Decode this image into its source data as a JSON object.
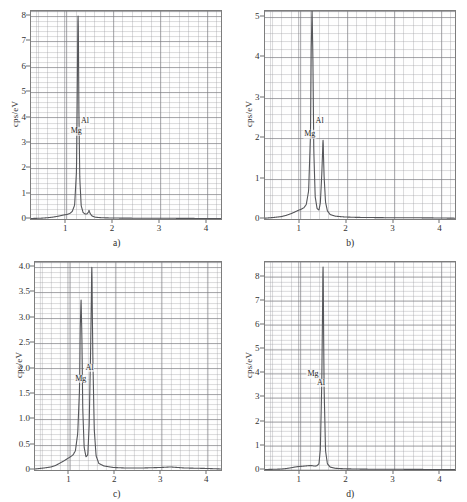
{
  "figure": {
    "panel_count": 4,
    "axis_label": "cps/eV",
    "background": "#ffffff",
    "trace_color": "#55565a",
    "grid_color": "#9a9a9f",
    "frame_color": "#7d7d7d"
  },
  "chart_data": [
    {
      "type": "line",
      "panel": "a",
      "caption": "a)",
      "title": "",
      "xlabel": "",
      "ylabel": "cps/eV",
      "xlim": [
        0.25,
        4.3
      ],
      "ylim": [
        0,
        8.2
      ],
      "xticks": [
        1,
        2,
        3,
        4
      ],
      "xticklabels": [
        "1",
        "2",
        "3",
        "4"
      ],
      "yticks": [
        0,
        1,
        2,
        3,
        4,
        5,
        6,
        7,
        8
      ],
      "yticklabels": [
        "0",
        "1",
        "2",
        "3",
        "4",
        "5",
        "6",
        "7",
        "8"
      ],
      "grid": true,
      "minor_grid": true,
      "annotations": [
        {
          "text": "Mg",
          "x": 1.215,
          "y": 3.45
        },
        {
          "text": "Al",
          "x": 1.4,
          "y": 3.85
        }
      ],
      "peaks": [
        {
          "element": "Mg",
          "x": 1.253,
          "height": 8.0,
          "width": 0.035
        },
        {
          "element": "Al",
          "x": 1.487,
          "height": 0.34,
          "width": 0.03
        }
      ],
      "baseline_noise_level": 0.06,
      "x": [
        0.25,
        0.45,
        0.6,
        0.7,
        0.8,
        0.88,
        0.95,
        1.02,
        1.08,
        1.13,
        1.18,
        1.22,
        1.235,
        1.253,
        1.27,
        1.29,
        1.32,
        1.36,
        1.4,
        1.44,
        1.47,
        1.487,
        1.51,
        1.55,
        1.62,
        1.75,
        1.95,
        2.2,
        2.6,
        3.0,
        3.5,
        4.0,
        4.3
      ],
      "y": [
        0.02,
        0.03,
        0.05,
        0.07,
        0.1,
        0.13,
        0.16,
        0.18,
        0.22,
        0.3,
        0.55,
        1.9,
        4.6,
        8.0,
        4.4,
        1.6,
        0.52,
        0.26,
        0.2,
        0.2,
        0.26,
        0.34,
        0.22,
        0.12,
        0.07,
        0.05,
        0.04,
        0.035,
        0.03,
        0.03,
        0.025,
        0.02,
        0.02
      ]
    },
    {
      "type": "line",
      "panel": "b",
      "caption": "b)",
      "title": "",
      "xlabel": "",
      "ylabel": "cps/eV",
      "xlim": [
        0.25,
        4.3
      ],
      "ylim": [
        0,
        5.15
      ],
      "xticks": [
        1,
        2,
        3,
        4
      ],
      "xticklabels": [
        "1",
        "2",
        "3",
        "4"
      ],
      "yticks": [
        0,
        1,
        2,
        3,
        4,
        5
      ],
      "yticklabels": [
        "0",
        "1",
        "2",
        "3",
        "4",
        "5"
      ],
      "grid": true,
      "minor_grid": true,
      "annotations": [
        {
          "text": "Mg",
          "x": 1.215,
          "y": 2.1
        },
        {
          "text": "Al",
          "x": 1.425,
          "y": 2.42
        }
      ],
      "peaks": [
        {
          "element": "Mg",
          "x": 1.253,
          "height": 5.15,
          "width": 0.035
        },
        {
          "element": "Al",
          "x": 1.487,
          "height": 1.95,
          "width": 0.032
        }
      ],
      "baseline_noise_level": 0.07,
      "x": [
        0.25,
        0.45,
        0.6,
        0.7,
        0.8,
        0.88,
        0.95,
        1.02,
        1.08,
        1.13,
        1.18,
        1.22,
        1.235,
        1.253,
        1.27,
        1.29,
        1.32,
        1.36,
        1.4,
        1.43,
        1.46,
        1.487,
        1.51,
        1.54,
        1.58,
        1.64,
        1.75,
        1.95,
        2.2,
        2.6,
        3.0,
        3.5,
        4.0,
        4.3
      ],
      "y": [
        0.02,
        0.04,
        0.06,
        0.09,
        0.13,
        0.17,
        0.21,
        0.24,
        0.28,
        0.36,
        0.7,
        2.1,
        4.2,
        5.15,
        4.1,
        1.7,
        0.55,
        0.26,
        0.22,
        0.4,
        1.1,
        1.95,
        1.05,
        0.42,
        0.2,
        0.11,
        0.07,
        0.05,
        0.04,
        0.035,
        0.03,
        0.03,
        0.025,
        0.02
      ]
    },
    {
      "type": "line",
      "panel": "c",
      "caption": "c)",
      "title": "",
      "xlabel": "",
      "ylabel": "cps/eV",
      "xlim": [
        0.25,
        4.3
      ],
      "ylim": [
        0,
        4.1
      ],
      "xticks": [
        1,
        2,
        3,
        4
      ],
      "xticklabels": [
        "1",
        "2",
        "3",
        "4"
      ],
      "yticks": [
        0,
        0.5,
        1.0,
        1.5,
        2.0,
        2.5,
        3.0,
        3.5,
        4.0
      ],
      "yticklabels": [
        "0",
        "0.5",
        "1.0",
        "1.5",
        "2.0",
        "2.5",
        "3.0",
        "3.5",
        "4.0"
      ],
      "grid": true,
      "minor_grid": true,
      "annotations": [
        {
          "text": "Mg",
          "x": 1.245,
          "y": 1.8
        },
        {
          "text": "Al",
          "x": 1.435,
          "y": 2.02
        }
      ],
      "peaks": [
        {
          "element": "Mg",
          "x": 1.253,
          "height": 3.35,
          "width": 0.035
        },
        {
          "element": "Al",
          "x": 1.487,
          "height": 4.0,
          "width": 0.033
        }
      ],
      "baseline_noise_level": 0.07,
      "x": [
        0.25,
        0.45,
        0.6,
        0.7,
        0.8,
        0.88,
        0.95,
        1.02,
        1.08,
        1.13,
        1.18,
        1.22,
        1.235,
        1.253,
        1.27,
        1.29,
        1.32,
        1.36,
        1.4,
        1.43,
        1.46,
        1.487,
        1.51,
        1.54,
        1.58,
        1.64,
        1.75,
        1.95,
        2.2,
        2.6,
        3.0,
        3.2,
        3.5,
        4.0,
        4.3
      ],
      "y": [
        0.02,
        0.04,
        0.06,
        0.09,
        0.14,
        0.18,
        0.22,
        0.26,
        0.3,
        0.38,
        0.72,
        1.6,
        2.8,
        3.35,
        2.7,
        1.2,
        0.45,
        0.26,
        0.3,
        0.9,
        2.3,
        4.0,
        2.2,
        0.8,
        0.28,
        0.13,
        0.08,
        0.05,
        0.04,
        0.04,
        0.05,
        0.06,
        0.04,
        0.03,
        0.02
      ]
    },
    {
      "type": "line",
      "panel": "d",
      "caption": "d)",
      "title": "",
      "xlabel": "",
      "ylabel": "cps/eV",
      "xlim": [
        0.25,
        4.3
      ],
      "ylim": [
        0,
        8.6
      ],
      "xticks": [
        1,
        2,
        3,
        4
      ],
      "xticklabels": [
        "1",
        "2",
        "3",
        "4"
      ],
      "yticks": [
        0,
        1,
        2,
        3,
        4,
        5,
        6,
        7,
        8
      ],
      "yticklabels": [
        "0",
        "1",
        "2",
        "3",
        "4",
        "5",
        "6",
        "7",
        "8"
      ],
      "grid": true,
      "minor_grid": true,
      "annotations": [
        {
          "text": "Mg",
          "x": 1.285,
          "y": 3.95
        },
        {
          "text": "Al",
          "x": 1.452,
          "y": 3.6
        }
      ],
      "peaks": [
        {
          "element": "Al",
          "x": 1.487,
          "height": 8.4,
          "width": 0.03
        },
        {
          "element": "Mg",
          "x": 1.253,
          "height": 0.18,
          "width": 0.03
        }
      ],
      "baseline_noise_level": 0.05,
      "x": [
        0.25,
        0.45,
        0.6,
        0.7,
        0.8,
        0.88,
        0.95,
        1.02,
        1.08,
        1.13,
        1.18,
        1.235,
        1.253,
        1.28,
        1.32,
        1.36,
        1.4,
        1.43,
        1.46,
        1.487,
        1.51,
        1.54,
        1.58,
        1.64,
        1.75,
        1.95,
        2.2,
        2.6,
        3.0,
        3.5,
        4.0,
        4.3
      ],
      "y": [
        0.02,
        0.03,
        0.04,
        0.06,
        0.09,
        0.12,
        0.14,
        0.15,
        0.16,
        0.17,
        0.18,
        0.18,
        0.18,
        0.17,
        0.16,
        0.18,
        0.26,
        0.85,
        3.6,
        8.4,
        3.4,
        0.8,
        0.26,
        0.12,
        0.07,
        0.05,
        0.04,
        0.03,
        0.03,
        0.025,
        0.02,
        0.02
      ]
    }
  ]
}
